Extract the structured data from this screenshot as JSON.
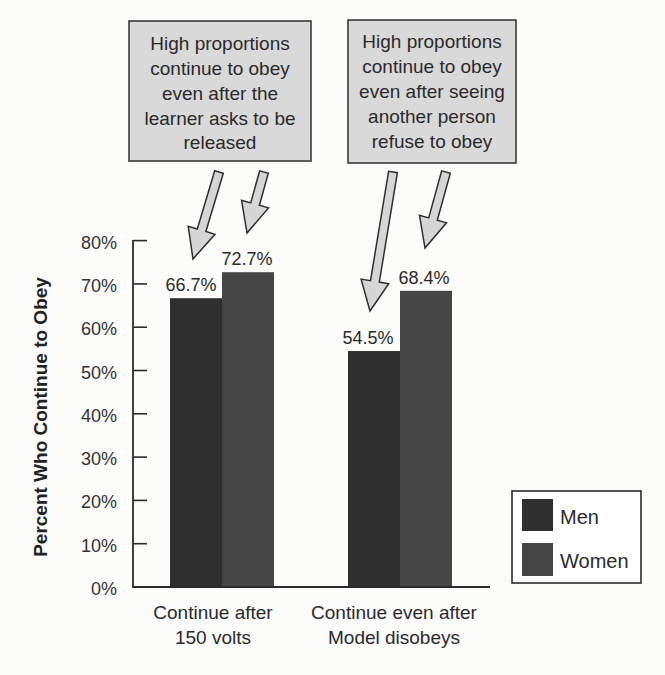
{
  "chart_data": {
    "type": "bar",
    "title": "",
    "xlabel": "",
    "ylabel": "Percent Who Continue to Obey",
    "ylim": [
      0,
      80
    ],
    "yticks": [
      "0%",
      "10%",
      "20%",
      "30%",
      "40%",
      "50%",
      "60%",
      "70%",
      "80%"
    ],
    "grid": false,
    "legend_position": "lower-right",
    "categories": [
      "Continue after 150 volts",
      "Continue even after Model disobeys"
    ],
    "category_lines": [
      [
        "Continue after",
        "150 volts"
      ],
      [
        "Continue even after",
        "Model disobeys"
      ]
    ],
    "series": [
      {
        "name": "Men",
        "values": [
          66.7,
          54.5
        ],
        "labels": [
          "66.7%",
          "54.5%"
        ],
        "color": "#2f2f2f"
      },
      {
        "name": "Women",
        "values": [
          72.7,
          68.4
        ],
        "labels": [
          "72.7%",
          "68.4%"
        ],
        "color": "#464646"
      }
    ],
    "annotations": [
      {
        "text": "High proportions continue to obey even after the learner asks to be released",
        "lines": [
          "High proportions",
          "continue to obey",
          "even after the",
          "learner asks to be",
          "released"
        ],
        "points_to": [
          "Continue after 150 volts / Men",
          "Continue after 150 volts / Women"
        ]
      },
      {
        "text": "High proportions continue to obey even after seeing another person refuse to obey",
        "lines": [
          "High proportions",
          "continue to obey",
          "even after seeing",
          "another person",
          "refuse to obey"
        ],
        "points_to": [
          "Continue even after Model disobeys / Men",
          "Continue even after Model disobeys / Women"
        ]
      }
    ]
  }
}
